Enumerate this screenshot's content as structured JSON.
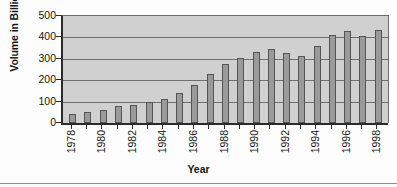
{
  "chart_data": {
    "type": "bar",
    "title": "",
    "xlabel": "Year",
    "ylabel": "Volume in Billion USD",
    "ylim": [
      0,
      500
    ],
    "yticks": [
      0,
      100,
      200,
      300,
      400,
      500
    ],
    "grid": true,
    "legend": false,
    "categories": [
      "1978",
      "1979",
      "1980",
      "1981",
      "1982",
      "1983",
      "1984",
      "1985",
      "1986",
      "1987",
      "1988",
      "1989",
      "1990",
      "1991",
      "1992",
      "1993",
      "1994",
      "1995",
      "1996",
      "1997",
      "1998"
    ],
    "xtick_labels": [
      "1978",
      "1980",
      "1982",
      "1984",
      "1986",
      "1988",
      "1990",
      "1992",
      "1994",
      "1996",
      "1998"
    ],
    "values": [
      40,
      50,
      60,
      80,
      86,
      97,
      110,
      138,
      176,
      227,
      274,
      303,
      331,
      345,
      327,
      314,
      360,
      412,
      430,
      408,
      436
    ],
    "series": [
      {
        "name": "Volume",
        "color": "#9a9a9a",
        "values": [
          40,
          50,
          60,
          80,
          86,
          97,
          110,
          138,
          176,
          227,
          274,
          303,
          331,
          345,
          327,
          314,
          360,
          412,
          430,
          408,
          436
        ]
      }
    ],
    "colors": {
      "bar_fill": "#9a9a9a",
      "bar_edge": "#545454",
      "plot_background": "#d0d0d0",
      "gridline": "#6f6f6f",
      "axis": "#2b2b2b",
      "text": "#161616",
      "figure_background": "#fdfdfd"
    }
  }
}
